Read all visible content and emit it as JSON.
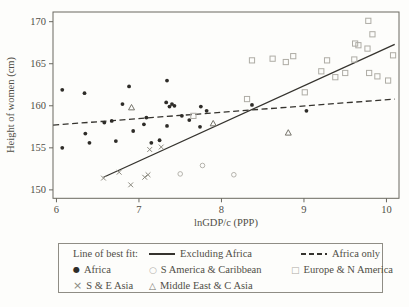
{
  "chart_data": {
    "type": "scatter",
    "title": "",
    "xlabel": "lnGDP/c (PPP)",
    "ylabel": "Height of women (cm)",
    "xlim": [
      5.958,
      10.152
    ],
    "ylim": [
      149.0,
      171.15
    ],
    "x_ticks": [
      6,
      7,
      8,
      9,
      10
    ],
    "y_ticks": [
      150,
      155,
      160,
      165,
      170
    ],
    "grid": false,
    "legend_position": "below",
    "series": [
      {
        "name": "Africa",
        "marker": "filled-circle",
        "color": "#2e2c28",
        "points": [
          [
            6.07,
            161.9
          ],
          [
            6.34,
            161.5
          ],
          [
            6.88,
            162.3
          ],
          [
            7.34,
            163.0
          ],
          [
            6.8,
            160.2
          ],
          [
            7.33,
            160.4
          ],
          [
            7.37,
            159.9
          ],
          [
            7.4,
            160.2
          ],
          [
            7.43,
            160.0
          ],
          [
            7.75,
            159.9
          ],
          [
            7.82,
            159.4
          ],
          [
            6.58,
            158.0
          ],
          [
            6.67,
            158.2
          ],
          [
            7.09,
            158.6
          ],
          [
            7.06,
            157.8
          ],
          [
            6.93,
            157.0
          ],
          [
            6.35,
            156.7
          ],
          [
            6.4,
            155.6
          ],
          [
            6.07,
            155.0
          ],
          [
            6.72,
            155.8
          ],
          [
            7.15,
            155.6
          ],
          [
            7.25,
            155.9
          ],
          [
            7.34,
            157.6
          ],
          [
            7.61,
            158.3
          ],
          [
            7.52,
            158.8
          ],
          [
            7.74,
            157.5
          ],
          [
            8.37,
            160.1
          ],
          [
            9.03,
            159.4
          ]
        ]
      },
      {
        "name": "S America & Caribbean",
        "marker": "open-circle",
        "color": "#b5b3ac",
        "points": [
          [
            7.5,
            151.9
          ],
          [
            7.77,
            152.9
          ],
          [
            8.15,
            151.8
          ]
        ]
      },
      {
        "name": "Europe & N America",
        "marker": "open-square",
        "color": "#aeaca5",
        "points": [
          [
            7.66,
            158.8
          ],
          [
            8.31,
            160.8
          ],
          [
            8.37,
            165.4
          ],
          [
            8.62,
            165.6
          ],
          [
            8.78,
            165.2
          ],
          [
            8.87,
            165.9
          ],
          [
            9.01,
            161.6
          ],
          [
            9.21,
            164.1
          ],
          [
            9.28,
            165.4
          ],
          [
            9.38,
            163.4
          ],
          [
            9.5,
            163.9
          ],
          [
            9.61,
            165.5
          ],
          [
            9.62,
            167.4
          ],
          [
            9.66,
            167.2
          ],
          [
            9.77,
            166.8
          ],
          [
            9.78,
            170.1
          ],
          [
            9.83,
            168.5
          ],
          [
            9.79,
            163.9
          ],
          [
            9.89,
            163.5
          ],
          [
            10.02,
            163.0
          ],
          [
            10.08,
            166.0
          ]
        ]
      },
      {
        "name": "S & E Asia",
        "marker": "x-cross",
        "color": "#8b897f",
        "points": [
          [
            6.57,
            151.4
          ],
          [
            6.76,
            152.1
          ],
          [
            6.9,
            150.6
          ],
          [
            7.07,
            151.5
          ],
          [
            7.11,
            151.8
          ],
          [
            7.13,
            154.8
          ],
          [
            7.27,
            155.1
          ]
        ]
      },
      {
        "name": "Middle East & C Asia",
        "marker": "open-triangle",
        "color": "#75736a",
        "points": [
          [
            6.91,
            159.8
          ],
          [
            7.9,
            157.9
          ],
          [
            8.81,
            156.8
          ]
        ]
      }
    ],
    "fit_lines": [
      {
        "name": "Excluding Africa",
        "style": "solid",
        "color": "#35332e",
        "x1": 6.57,
        "y1": 151.5,
        "x2": 10.1,
        "y2": 167.3
      },
      {
        "name": "Africa only",
        "style": "dashed",
        "color": "#35332e",
        "x1": 5.96,
        "y1": 157.7,
        "x2": 10.1,
        "y2": 160.8
      }
    ]
  },
  "legend": {
    "fit_caption": "Line of best fit:",
    "fit_items": [
      {
        "label": "Excluding Africa",
        "style": "solid"
      },
      {
        "label": "Africa only",
        "style": "dashed"
      }
    ],
    "marker_items": [
      {
        "label": "Africa",
        "glyph": "●",
        "marker": "filled-circle"
      },
      {
        "label": "S America & Caribbean",
        "glyph": "○",
        "marker": "open-circle"
      },
      {
        "label": "Europe & N America",
        "glyph": "□",
        "marker": "open-square"
      },
      {
        "label": "S & E Asia",
        "glyph": "×",
        "marker": "x-cross"
      },
      {
        "label": "Middle East & C Asia",
        "glyph": "△",
        "marker": "open-triangle"
      }
    ]
  },
  "colors": {
    "axis": "#6a6860",
    "text": "#504e46",
    "background": "#fdfdfb"
  }
}
